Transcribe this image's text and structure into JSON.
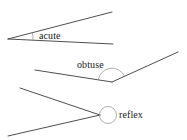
{
  "figure": {
    "width": 187,
    "height": 140,
    "background_color": "#ffffff",
    "stroke_color": "#3a3a3a",
    "arc_color": "#8c8c8c",
    "text_color": "#1a1a1a"
  },
  "angles": [
    {
      "name": "acute",
      "label": "acute",
      "vertex": [
        8,
        39
      ],
      "rays": [
        {
          "to": [
            112,
            12
          ]
        },
        {
          "to": [
            113,
            44
          ]
        }
      ],
      "marker": {
        "kind": "arc",
        "radius": 25,
        "note": "small arc spanning the narrow opening at the vertex"
      },
      "label_position": [
        39,
        30
      ]
    },
    {
      "name": "obtuse",
      "label": "obtuse",
      "vertex": [
        112,
        82
      ],
      "rays": [
        {
          "to": [
            35,
            70
          ]
        },
        {
          "to": [
            178,
            52
          ]
        }
      ],
      "marker": {
        "kind": "arc",
        "radius": 14,
        "note": "arc across the wide opening above the vertex"
      },
      "label_position": [
        77,
        59
      ]
    },
    {
      "name": "reflex",
      "label": "reflex",
      "vertex": [
        100,
        115
      ],
      "rays": [
        {
          "to": [
            20,
            88
          ]
        },
        {
          "to": [
            8,
            136
          ]
        }
      ],
      "marker": {
        "kind": "circle",
        "center": [
          108,
          115
        ],
        "radius": 8.5,
        "note": "near-full circle marking the reflex side of the angle"
      },
      "label_position": [
        119,
        109
      ]
    }
  ]
}
